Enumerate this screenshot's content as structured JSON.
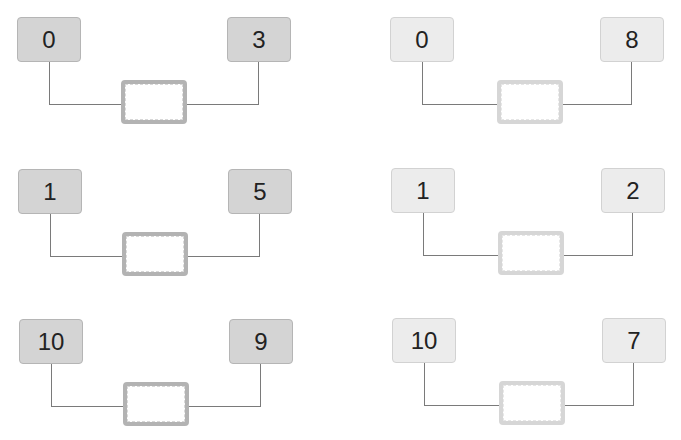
{
  "colors": {
    "left_column_box": "#d4d4d4",
    "right_column_box": "#ececec",
    "connector_line": "#7a7a7a",
    "answer_border_dark": "#b3b3b3",
    "answer_border_light": "#d6d6d6"
  },
  "groups": [
    {
      "left": "0",
      "right": "3",
      "answer": ""
    },
    {
      "left": "0",
      "right": "8",
      "answer": ""
    },
    {
      "left": "1",
      "right": "5",
      "answer": ""
    },
    {
      "left": "1",
      "right": "2",
      "answer": ""
    },
    {
      "left": "10",
      "right": "9",
      "answer": ""
    },
    {
      "left": "10",
      "right": "7",
      "answer": ""
    }
  ]
}
